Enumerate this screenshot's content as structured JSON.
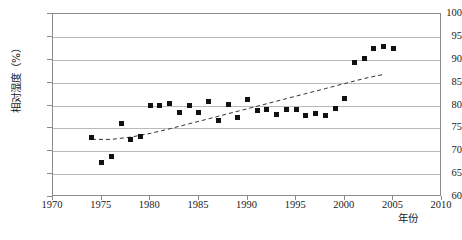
{
  "chart_data": {
    "type": "scatter",
    "title": "",
    "xlabel": "年份",
    "ylabel": "相对湿度（%）",
    "xlim": [
      1970,
      2010
    ],
    "ylim": [
      60,
      100
    ],
    "xticks": [
      1970,
      1975,
      1980,
      1985,
      1990,
      1995,
      2000,
      2005,
      2010
    ],
    "yticks": [
      60,
      65,
      70,
      75,
      80,
      85,
      90,
      95,
      100
    ],
    "xtick_labels": [
      "1970",
      "1975",
      "1980",
      "1985",
      "1990",
      "1995",
      "2000",
      "2005",
      "2010"
    ],
    "ytick_labels": [
      "60",
      "65",
      "70",
      "75",
      "80",
      "85",
      "90",
      "95",
      "100"
    ],
    "grid": "horizontal",
    "legend": null,
    "marker": "filled-square",
    "marker_color": "#111111",
    "series": [
      {
        "name": "相对湿度",
        "points": [
          {
            "x": 1974,
            "y": 72.9
          },
          {
            "x": 1975,
            "y": 67.6
          },
          {
            "x": 1976,
            "y": 68.8
          },
          {
            "x": 1977,
            "y": 76.1
          },
          {
            "x": 1978,
            "y": 72.5
          },
          {
            "x": 1979,
            "y": 73.3
          },
          {
            "x": 1980,
            "y": 79.9
          },
          {
            "x": 1981,
            "y": 79.9
          },
          {
            "x": 1982,
            "y": 80.4
          },
          {
            "x": 1983,
            "y": 78.4
          },
          {
            "x": 1984,
            "y": 79.9
          },
          {
            "x": 1985,
            "y": 78.4
          },
          {
            "x": 1986,
            "y": 80.9
          },
          {
            "x": 1987,
            "y": 76.7
          },
          {
            "x": 1988,
            "y": 80.2
          },
          {
            "x": 1989,
            "y": 77.3
          },
          {
            "x": 1990,
            "y": 81.4
          },
          {
            "x": 1991,
            "y": 79.0
          },
          {
            "x": 1992,
            "y": 79.1
          },
          {
            "x": 1993,
            "y": 78.1
          },
          {
            "x": 1994,
            "y": 79.2
          },
          {
            "x": 1995,
            "y": 79.2
          },
          {
            "x": 1996,
            "y": 77.8
          },
          {
            "x": 1997,
            "y": 78.3
          },
          {
            "x": 1998,
            "y": 77.9
          },
          {
            "x": 1999,
            "y": 79.3
          },
          {
            "x": 2000,
            "y": 81.5
          },
          {
            "x": 2001,
            "y": 89.5
          },
          {
            "x": 2002,
            "y": 90.3
          },
          {
            "x": 2003,
            "y": 92.4
          },
          {
            "x": 2004,
            "y": 92.9
          },
          {
            "x": 2005,
            "y": 92.5
          }
        ]
      }
    ],
    "trendline": {
      "style": "dashed",
      "color": "#333333",
      "points": [
        {
          "x": 1974.0,
          "y": 72.6
        },
        {
          "x": 1976.0,
          "y": 72.6
        },
        {
          "x": 1978.0,
          "y": 73.1
        },
        {
          "x": 1980.0,
          "y": 73.9
        },
        {
          "x": 1982.0,
          "y": 74.9
        },
        {
          "x": 1984.0,
          "y": 76.0
        },
        {
          "x": 1986.0,
          "y": 77.1
        },
        {
          "x": 1988.0,
          "y": 78.2
        },
        {
          "x": 1990.0,
          "y": 79.3
        },
        {
          "x": 1992.0,
          "y": 80.4
        },
        {
          "x": 1994.0,
          "y": 81.5
        },
        {
          "x": 1996.0,
          "y": 82.6
        },
        {
          "x": 1998.0,
          "y": 83.7
        },
        {
          "x": 2000.0,
          "y": 84.8
        },
        {
          "x": 2002.0,
          "y": 85.9
        },
        {
          "x": 2004.0,
          "y": 86.8
        }
      ]
    }
  }
}
